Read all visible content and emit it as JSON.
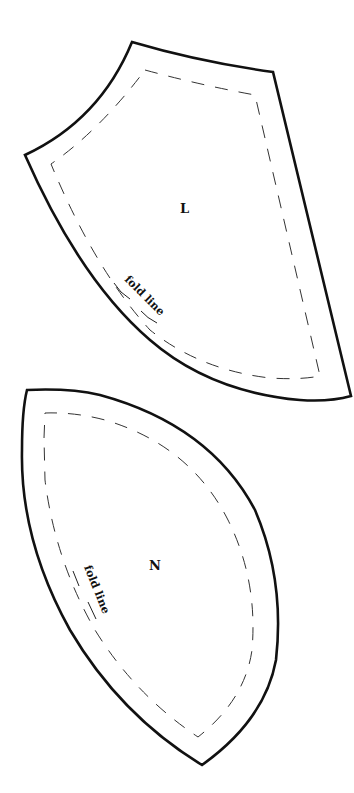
{
  "sheet": {
    "background": "#ffffff",
    "line_color": "#111111"
  },
  "pieces": [
    {
      "id": "L",
      "label": "L",
      "fold_text": "fold line"
    },
    {
      "id": "N",
      "label": "N",
      "fold_text": "fold line"
    }
  ]
}
